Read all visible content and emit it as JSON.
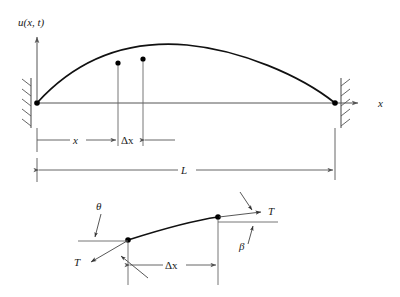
{
  "figure": {
    "title_visible": false,
    "background_color": "#ffffff",
    "line_color": "#555555",
    "curve_color": "#111111",
    "labels": {
      "u_axis": "u(x, t)",
      "x_axis": "x",
      "x_dim": "x",
      "delta_x_top": "Δx",
      "length": "L",
      "delta_x_bottom": "Δx",
      "theta": "θ",
      "beta": "β",
      "tension_left": "T",
      "tension_right": "T"
    }
  },
  "top_diagram": {
    "name": "vibrating-string-deflection",
    "left_support_x": 37,
    "right_support_x": 335,
    "baseline_y": 103,
    "curve_peak_y": 52,
    "points": [
      {
        "label": "x",
        "x": 118,
        "y": 63
      },
      {
        "label": "x + Δx",
        "x": 143,
        "y": 59
      }
    ],
    "dimensions": [
      {
        "name": "x",
        "from": 37,
        "to": 118,
        "y": 140
      },
      {
        "name": "Δx",
        "from": 118,
        "to": 143,
        "y": 140
      },
      {
        "name": "L",
        "from": 37,
        "to": 335,
        "y": 170
      }
    ]
  },
  "bottom_diagram": {
    "name": "string-element-free-body",
    "left_node": {
      "x": 128,
      "y": 240
    },
    "right_node": {
      "x": 218,
      "y": 217
    },
    "delta_x_dim": {
      "from": 128,
      "to": 240,
      "y": 265
    },
    "angles": [
      {
        "symbol": "θ",
        "at": "left_node"
      },
      {
        "symbol": "β",
        "at": "right_node"
      }
    ],
    "forces": [
      {
        "symbol": "T",
        "at": "left_node",
        "direction": "down-left"
      },
      {
        "symbol": "T",
        "at": "right_node",
        "direction": "up-right"
      }
    ]
  }
}
